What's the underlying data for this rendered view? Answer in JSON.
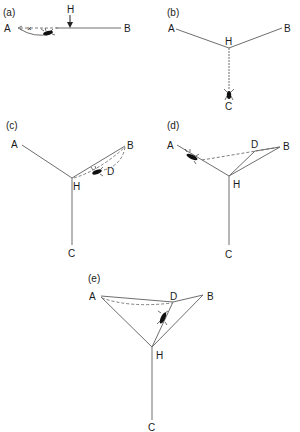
{
  "figure": {
    "colors": {
      "line": "#6e6e6e",
      "spider": "#111111",
      "text": "#1a1a1a",
      "background": "#ffffff"
    },
    "panels": [
      {
        "id": "a",
        "label": "(a)",
        "nodes": {
          "A": "A",
          "B": "B",
          "H": "H"
        },
        "annotations": {
          "cross_mark": "×"
        },
        "elements": [
          "solid-line A-B",
          "dashed line A-H",
          "curved thread under A-H",
          "arrow from H down to line",
          "spider near midpoint"
        ]
      },
      {
        "id": "b",
        "label": "(b)",
        "nodes": {
          "A": "A",
          "B": "B",
          "H": "H",
          "C": "C"
        },
        "elements": [
          "line A-H",
          "line H-B",
          "line H-C",
          "spider descending near C"
        ]
      },
      {
        "id": "c",
        "label": "(c)",
        "nodes": {
          "A": "A",
          "B": "B",
          "H": "H",
          "C": "C",
          "D": "D"
        },
        "elements": [
          "line A-H",
          "line H-B",
          "line H-C",
          "dashed threads H-B via D",
          "spider near D"
        ]
      },
      {
        "id": "d",
        "label": "(d)",
        "nodes": {
          "A": "A",
          "B": "B",
          "H": "H",
          "C": "C",
          "D": "D"
        },
        "elements": [
          "line A-H",
          "line H-B",
          "line H-C",
          "line H-D",
          "line D-B",
          "dashed line A-B",
          "spider near A"
        ]
      },
      {
        "id": "e",
        "label": "(e)",
        "nodes": {
          "A": "A",
          "B": "B",
          "H": "H",
          "C": "C",
          "D": "D"
        },
        "elements": [
          "line A-D",
          "line D-B",
          "line A-H",
          "line B-H",
          "line D-H",
          "line H-C",
          "dashed curve A-D",
          "spider on D-H"
        ]
      }
    ]
  }
}
